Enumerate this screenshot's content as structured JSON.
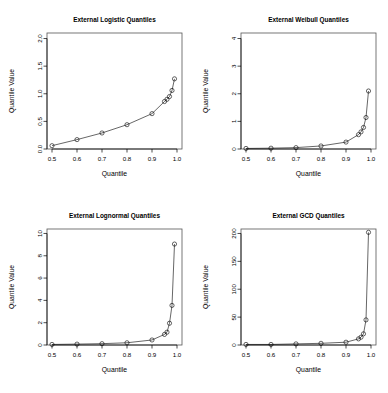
{
  "figure": {
    "axis_label_x": "Quantile",
    "axis_label_y": "Quantile Value",
    "point_symbol": "open-circle",
    "line_color": "#000000",
    "background": "#ffffff"
  },
  "chart_data": [
    {
      "type": "scatter",
      "title": "External Logistic Quantiles",
      "xlabel": "Quantile",
      "ylabel": "Quantile Value",
      "xlim": [
        0.48,
        1.02
      ],
      "ylim": [
        0.0,
        2.1
      ],
      "xticks": [
        0.5,
        0.6,
        0.7,
        0.8,
        0.9,
        1.0
      ],
      "xticklabels": [
        "0.5",
        "0.6",
        "0.7",
        "0.8",
        "0.9",
        "1.0"
      ],
      "yticks": [
        0.0,
        0.5,
        1.0,
        1.5,
        2.0
      ],
      "yticklabels": [
        "0.0",
        "0.5",
        "1.0",
        "1.5",
        "2.0"
      ],
      "grid": false,
      "legend": null,
      "x": [
        0.5,
        0.6,
        0.7,
        0.8,
        0.9,
        0.95,
        0.96,
        0.97,
        0.98,
        0.99
      ],
      "y": [
        0.06,
        0.17,
        0.29,
        0.44,
        0.64,
        0.86,
        0.9,
        0.95,
        1.06,
        1.27
      ]
    },
    {
      "type": "scatter",
      "title": "External Weibull Quantiles",
      "xlabel": "Quantile",
      "ylabel": "Quantile Value",
      "xlim": [
        0.48,
        1.02
      ],
      "ylim": [
        0.0,
        4.2
      ],
      "xticks": [
        0.5,
        0.6,
        0.7,
        0.8,
        0.9,
        1.0
      ],
      "xticklabels": [
        "0.5",
        "0.6",
        "0.7",
        "0.8",
        "0.9",
        "1.0"
      ],
      "yticks": [
        0,
        1,
        2,
        3,
        4
      ],
      "yticklabels": [
        "0",
        "1",
        "2",
        "3",
        "4"
      ],
      "grid": false,
      "legend": null,
      "x": [
        0.5,
        0.6,
        0.7,
        0.8,
        0.9,
        0.95,
        0.96,
        0.97,
        0.98,
        0.99
      ],
      "y": [
        0.02,
        0.03,
        0.05,
        0.11,
        0.25,
        0.52,
        0.62,
        0.78,
        1.14,
        2.1
      ]
    },
    {
      "type": "scatter",
      "title": "External Lognormal Quantiles",
      "xlabel": "Quantile",
      "ylabel": "Quantile Value",
      "xlim": [
        0.48,
        1.02
      ],
      "ylim": [
        0.0,
        10.4
      ],
      "xticks": [
        0.5,
        0.6,
        0.7,
        0.8,
        0.9,
        1.0
      ],
      "xticklabels": [
        "0.5",
        "0.6",
        "0.7",
        "0.8",
        "0.9",
        "1.0"
      ],
      "yticks": [
        0,
        2,
        4,
        6,
        8,
        10
      ],
      "yticklabels": [
        "0",
        "2",
        "4",
        "6",
        "8",
        "10"
      ],
      "grid": false,
      "legend": null,
      "x": [
        0.5,
        0.6,
        0.7,
        0.8,
        0.9,
        0.95,
        0.96,
        0.97,
        0.98,
        0.99
      ],
      "y": [
        0.05,
        0.08,
        0.12,
        0.2,
        0.45,
        0.95,
        1.15,
        1.95,
        3.55,
        9.05
      ]
    },
    {
      "type": "scatter",
      "title": "External GCD Quantiles",
      "xlabel": "Quantile",
      "ylabel": "Quantile Value",
      "xlim": [
        0.48,
        1.02
      ],
      "ylim": [
        0,
        208
      ],
      "xticks": [
        0.5,
        0.6,
        0.7,
        0.8,
        0.9,
        1.0
      ],
      "xticklabels": [
        "0.5",
        "0.6",
        "0.7",
        "0.8",
        "0.9",
        "1.0"
      ],
      "yticks": [
        0,
        50,
        100,
        150,
        200
      ],
      "yticklabels": [
        "0",
        "50",
        "100",
        "150",
        "200"
      ],
      "grid": false,
      "legend": null,
      "x": [
        0.5,
        0.6,
        0.7,
        0.8,
        0.9,
        0.95,
        0.96,
        0.97,
        0.98,
        0.99
      ],
      "y": [
        1,
        1,
        2,
        3,
        5,
        11,
        14,
        20,
        45,
        202
      ]
    }
  ]
}
